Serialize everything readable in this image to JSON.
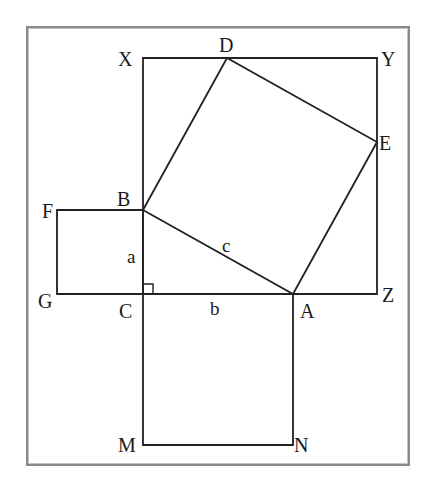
{
  "diagram": {
    "type": "geometry-proof-figure",
    "colors": {
      "line": "#222222",
      "frame": "#8a8a8a",
      "background": "#ffffff"
    },
    "frame": {
      "x": 27,
      "y": 27,
      "w": 382,
      "h": 438
    },
    "points": {
      "X": {
        "label": "X",
        "x": 143,
        "y": 58
      },
      "D": {
        "label": "D",
        "x": 227,
        "y": 58
      },
      "Y": {
        "label": "Y",
        "x": 377,
        "y": 58
      },
      "E": {
        "label": "E",
        "x": 377,
        "y": 142
      },
      "F": {
        "label": "F",
        "x": 57,
        "y": 210
      },
      "B": {
        "label": "B",
        "x": 143,
        "y": 210
      },
      "G": {
        "label": "G",
        "x": 57,
        "y": 294
      },
      "C": {
        "label": "C",
        "x": 143,
        "y": 294
      },
      "A": {
        "label": "A",
        "x": 293,
        "y": 294
      },
      "Z": {
        "label": "Z",
        "x": 377,
        "y": 294
      },
      "M": {
        "label": "M",
        "x": 143,
        "y": 445
      },
      "N": {
        "label": "N",
        "x": 293,
        "y": 445
      }
    },
    "sides": {
      "a": {
        "label": "a",
        "between": "B-C"
      },
      "b": {
        "label": "b",
        "between": "C-A"
      },
      "c": {
        "label": "c",
        "between": "B-A"
      }
    },
    "shapes": [
      {
        "name": "square-on-a",
        "vertices": [
          "F",
          "B",
          "C",
          "G"
        ]
      },
      {
        "name": "square-on-b",
        "vertices": [
          "C",
          "A",
          "N",
          "M"
        ]
      },
      {
        "name": "square-on-c",
        "vertices": [
          "B",
          "A",
          "E",
          "D"
        ]
      },
      {
        "name": "enclosing-square",
        "vertices": [
          "X",
          "Y",
          "Z",
          "C"
        ]
      },
      {
        "name": "right-triangle",
        "vertices": [
          "A",
          "B",
          "C"
        ]
      }
    ],
    "right_angle_at": "C"
  }
}
